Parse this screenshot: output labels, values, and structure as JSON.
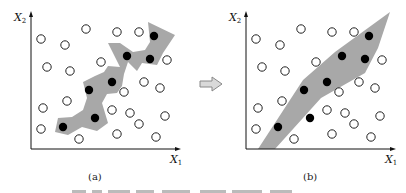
{
  "figure": {
    "arrow": {
      "fill": "#d9d9d9",
      "stroke": "#888888"
    },
    "colors": {
      "region": "#a8a8a8",
      "filled_point": "#000000",
      "hollow_point": "#ffffff",
      "axis": "#111111"
    },
    "panels": [
      {
        "id": "a",
        "caption": "(a)",
        "x_axis_label": "X",
        "x_axis_sub": "1",
        "y_axis_label": "X",
        "y_axis_sub": "2",
        "region_description": "narrow jagged region enclosing the positive points"
      },
      {
        "id": "b",
        "caption": "(b)",
        "x_axis_label": "X",
        "x_axis_sub": "1",
        "y_axis_label": "X",
        "y_axis_sub": "2",
        "region_description": "broad smooth convex band enclosing the positive points"
      }
    ],
    "hollow_points": [
      [
        41,
        39
      ],
      [
        65,
        45
      ],
      [
        86,
        29
      ],
      [
        117,
        32
      ],
      [
        139,
        32
      ],
      [
        47,
        67
      ],
      [
        70,
        71
      ],
      [
        101,
        62
      ],
      [
        167,
        60
      ],
      [
        144,
        82
      ],
      [
        160,
        88
      ],
      [
        124,
        92
      ],
      [
        43,
        108
      ],
      [
        67,
        101
      ],
      [
        112,
        110
      ],
      [
        130,
        113
      ],
      [
        165,
        116
      ],
      [
        139,
        124
      ],
      [
        41,
        129
      ],
      [
        79,
        139
      ],
      [
        117,
        134
      ],
      [
        156,
        137
      ]
    ],
    "filled_points": [
      [
        154,
        36
      ],
      [
        127,
        56
      ],
      [
        150,
        59
      ],
      [
        112,
        82
      ],
      [
        89,
        90
      ],
      [
        95,
        118
      ],
      [
        63,
        127
      ]
    ],
    "bottom_caption_truncated": "图 … (caption cut off)"
  }
}
